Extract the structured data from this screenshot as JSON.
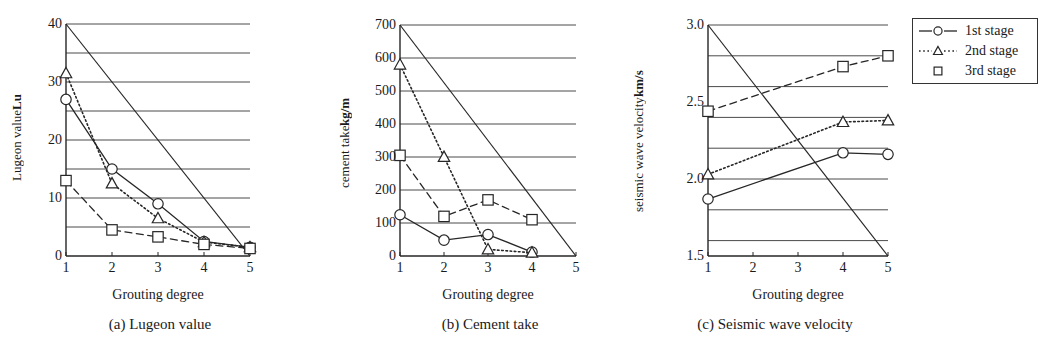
{
  "figure": {
    "xaxis_title": "Grouting degree",
    "legend": {
      "items": [
        {
          "label": "1st stage",
          "marker": "circle",
          "line": "solid"
        },
        {
          "label": "2nd stage",
          "marker": "triangle",
          "line": "dotted"
        },
        {
          "label": "3rd stage",
          "marker": "square",
          "line": "none"
        }
      ]
    }
  },
  "chart_data": [
    {
      "type": "line",
      "panel": "a",
      "caption": "(a) Lugeon value",
      "title": "",
      "xlabel": "Grouting degree",
      "ylabel": "Lugeon value",
      "ylabel_unit": "Lu",
      "x": [
        1,
        2,
        3,
        4,
        5
      ],
      "xlim": [
        1,
        5
      ],
      "ylim": [
        0,
        40
      ],
      "yticks": [
        0,
        10,
        20,
        30,
        40
      ],
      "ygrid": [
        5,
        10,
        15,
        20,
        25,
        30,
        35,
        40
      ],
      "grid": true,
      "legend_position": "external-right",
      "series": [
        {
          "name": "1st stage",
          "marker": "circle",
          "line": "solid",
          "x": [
            1,
            2,
            3,
            4,
            5
          ],
          "values": [
            27,
            15,
            9,
            2.5,
            1.5
          ]
        },
        {
          "name": "2nd stage",
          "marker": "triangle",
          "line": "dotted",
          "x": [
            1,
            2,
            3,
            4,
            5
          ],
          "values": [
            31.5,
            12.5,
            6.5,
            2.4,
            1.5
          ]
        },
        {
          "name": "3rd stage",
          "marker": "square",
          "line": "dashed",
          "x": [
            1,
            2,
            3,
            4,
            5
          ],
          "values": [
            13,
            4.5,
            3.3,
            2,
            1.3
          ]
        }
      ],
      "reference_line": {
        "from": [
          1,
          40
        ],
        "to": [
          5,
          0
        ],
        "style": "solid"
      }
    },
    {
      "type": "line",
      "panel": "b",
      "caption": "(b) Cement take",
      "title": "",
      "xlabel": "Grouting degree",
      "ylabel": "cement take",
      "ylabel_unit": "kg/m",
      "x": [
        1,
        2,
        3,
        4,
        5
      ],
      "xlim": [
        1,
        5
      ],
      "ylim": [
        0,
        700
      ],
      "yticks": [
        0,
        100,
        200,
        300,
        400,
        500,
        600,
        700
      ],
      "ygrid": [
        100,
        200,
        300,
        400,
        500,
        600,
        700
      ],
      "grid": true,
      "legend_position": "external-right",
      "series": [
        {
          "name": "1st stage",
          "marker": "circle",
          "line": "solid",
          "x": [
            1,
            2,
            3,
            4
          ],
          "values": [
            125,
            48,
            65,
            12
          ]
        },
        {
          "name": "2nd stage",
          "marker": "triangle",
          "line": "dotted",
          "x": [
            1,
            2,
            3,
            4
          ],
          "values": [
            580,
            300,
            20,
            10
          ]
        },
        {
          "name": "3rd stage",
          "marker": "square",
          "line": "dashed",
          "x": [
            1,
            2,
            3,
            4
          ],
          "values": [
            305,
            120,
            170,
            110
          ]
        }
      ],
      "reference_line": {
        "from": [
          1,
          700
        ],
        "to": [
          5,
          0
        ],
        "style": "solid"
      }
    },
    {
      "type": "line",
      "panel": "c",
      "caption": "(c) Seismic wave velocity",
      "title": "",
      "xlabel": "Grouting degree",
      "ylabel": "seismic wave velocity",
      "ylabel_unit": "km/s",
      "x": [
        1,
        2,
        3,
        4,
        5
      ],
      "xlim": [
        1,
        5
      ],
      "ylim": [
        1.5,
        3.0
      ],
      "yticks": [
        1.5,
        2.0,
        2.5,
        3.0
      ],
      "ygrid": [
        1.6,
        1.8,
        2.0,
        2.2,
        2.4,
        2.6,
        2.8,
        3.0
      ],
      "grid": true,
      "legend_position": "external-right",
      "series": [
        {
          "name": "1st stage",
          "marker": "circle",
          "line": "solid",
          "x": [
            1,
            4,
            5
          ],
          "values": [
            1.87,
            2.17,
            2.16
          ]
        },
        {
          "name": "2nd stage",
          "marker": "triangle",
          "line": "dotted",
          "x": [
            1,
            4,
            5
          ],
          "values": [
            2.03,
            2.37,
            2.38
          ]
        },
        {
          "name": "3rd stage",
          "marker": "square",
          "line": "dashed",
          "x": [
            1,
            4,
            5
          ],
          "values": [
            2.44,
            2.73,
            2.8
          ]
        }
      ],
      "reference_line": {
        "from": [
          1,
          3.0
        ],
        "to": [
          5,
          1.5
        ],
        "style": "solid"
      }
    }
  ],
  "tick_labels": {
    "a_y": [
      "0",
      "10",
      "20",
      "30",
      "40"
    ],
    "b_y": [
      "0",
      "100",
      "200",
      "300",
      "400",
      "500",
      "600",
      "700"
    ],
    "c_y": [
      "1.5",
      "2.0",
      "2.5",
      "3.0"
    ],
    "x": [
      "1",
      "2",
      "3",
      "4",
      "5"
    ]
  }
}
